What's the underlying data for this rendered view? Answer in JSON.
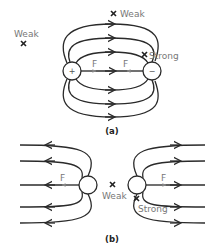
{
  "figure_a": {
    "caption": "(a)",
    "positive_charge": {
      "sign": "+",
      "cx": 72,
      "cy": 71
    },
    "negative_charge": {
      "sign": "−",
      "cx": 152,
      "cy": 71
    },
    "force_labels": [
      "F",
      "F"
    ],
    "markers": [
      {
        "label": "Weak",
        "type": "cross",
        "position": "top-center"
      },
      {
        "label": "Weak",
        "type": "cross",
        "position": "far-left"
      },
      {
        "label": "Strong",
        "type": "cross",
        "position": "near-negative-charge"
      }
    ],
    "field_direction": "positive-to-negative"
  },
  "figure_b": {
    "caption": "(b)",
    "left_charge": {
      "cx": 88,
      "cy": 185
    },
    "right_charge": {
      "cx": 137,
      "cy": 185
    },
    "force_labels": [
      "F",
      "F"
    ],
    "markers": [
      {
        "label": "Weak",
        "type": "cross",
        "position": "between-charges"
      },
      {
        "label": "Strong",
        "type": "cross",
        "position": "near-right-charge"
      }
    ],
    "field_direction": "outward-away-from-charges"
  },
  "colors": {
    "line": "#2a2a2a",
    "label": "#777777",
    "force_arrow": "#888888",
    "background": "#ffffff"
  }
}
